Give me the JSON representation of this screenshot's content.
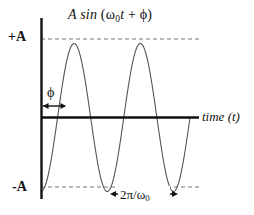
{
  "figure": {
    "title_parts": {
      "amplitude": "A",
      "function": "sin",
      "open_paren": "(",
      "omega": "ω",
      "omega_subscript": "0",
      "time_var": "t",
      "plus": "+",
      "phase": "ϕ",
      "close_paren": ")"
    },
    "title_plain": "A sin (ω0t + ϕ)",
    "axes": {
      "y_top_label": "+A",
      "y_bottom_label": "-A",
      "x_axis_label_italic": "time",
      "x_axis_label_var": "(t)",
      "x_axis_label_plain": "time (t)"
    },
    "annotations": {
      "phase_symbol": "ϕ",
      "period_numerator": "2π",
      "period_slash": "/",
      "period_omega": "ω",
      "period_omega_subscript": "0",
      "period_plain": "2π/ω0"
    },
    "colors": {
      "background": "#ffffff",
      "axis": "#111111",
      "curve": "#555555",
      "dashed_guide": "#777777",
      "text": "#111111"
    }
  },
  "chart_data": {
    "type": "line",
    "title": "A sin (ω0t + ϕ)",
    "xlabel": "time (t)",
    "ylabel": "",
    "grid": false,
    "legend": "none",
    "ylim": [
      -1,
      1
    ],
    "ytick_values": [
      1,
      -1
    ],
    "ytick_labels": [
      "+A",
      "-A"
    ],
    "xtick_values": [],
    "xtick_labels": [],
    "function": "A*sin(omega0*t + phi)",
    "parameters": {
      "amplitude_A": 1,
      "cycles_shown": 2.25,
      "phase_shift_phi_fraction_of_period": 0.25,
      "phase_marked": true,
      "period_marked": true
    },
    "annotations": [
      {
        "name": "phase-arrow",
        "label": "ϕ",
        "type": "double-arrow",
        "axis": "x",
        "from": 0.0,
        "to": 0.25,
        "units": "periods"
      },
      {
        "name": "period-arrow",
        "label": "2π/ω0",
        "type": "double-arrow",
        "axis": "x",
        "from": 0.75,
        "to": 1.75,
        "units": "periods"
      },
      {
        "name": "plus-a-guide",
        "label": "+A",
        "type": "dashed-horizontal",
        "y": 1
      },
      {
        "name": "minus-a-guide",
        "label": "-A",
        "type": "dashed-horizontal",
        "y": -1
      }
    ],
    "series": [
      {
        "name": "A sin (ω0t + ϕ)",
        "x": [
          0.0,
          0.05,
          0.1,
          0.15,
          0.2,
          0.25,
          0.3,
          0.35,
          0.4,
          0.45,
          0.5,
          0.55,
          0.6,
          0.65,
          0.7,
          0.75,
          0.8,
          0.85,
          0.9,
          0.95,
          1.0,
          1.05,
          1.1,
          1.15,
          1.2,
          1.25,
          1.3,
          1.35,
          1.4,
          1.45,
          1.5,
          1.55,
          1.6,
          1.65,
          1.7,
          1.75,
          1.8,
          1.85,
          1.9,
          1.95,
          2.0,
          2.05,
          2.1,
          2.15,
          2.2,
          2.25
        ],
        "y": [
          -1.0,
          -0.95,
          -0.81,
          -0.59,
          -0.31,
          0.0,
          0.31,
          0.59,
          0.81,
          0.95,
          1.0,
          0.95,
          0.81,
          0.59,
          0.31,
          0.0,
          -0.31,
          -0.59,
          -0.81,
          -0.95,
          -1.0,
          -0.95,
          -0.81,
          -0.59,
          -0.31,
          0.0,
          0.31,
          0.59,
          0.81,
          0.95,
          1.0,
          0.95,
          0.81,
          0.59,
          0.31,
          0.0,
          -0.31,
          -0.59,
          -0.81,
          -0.95,
          -1.0,
          -0.95,
          -0.81,
          -0.59,
          -0.31,
          0.0
        ]
      }
    ]
  }
}
